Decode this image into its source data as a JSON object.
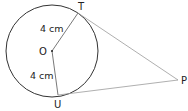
{
  "diagram": {
    "type": "geometry",
    "points": {
      "O": {
        "label": "O",
        "x": 52,
        "y": 51
      },
      "T": {
        "label": "T",
        "x": 78,
        "y": 13
      },
      "U": {
        "label": "U",
        "x": 58,
        "y": 94
      },
      "P": {
        "label": "P",
        "x": 178,
        "y": 80
      }
    },
    "circle": {
      "center": "O",
      "r": 46,
      "radius_label": "4 cm"
    },
    "segments": [
      {
        "from": "O",
        "to": "T",
        "label": "4 cm"
      },
      {
        "from": "O",
        "to": "U",
        "label": "4 cm"
      },
      {
        "from": "T",
        "to": "P",
        "label": ""
      },
      {
        "from": "U",
        "to": "P",
        "label": ""
      }
    ],
    "labels": {
      "radius_OT": "4 cm",
      "radius_OU": "4 cm",
      "point_O": "O",
      "point_T": "T",
      "point_U": "U",
      "point_P": "P"
    },
    "colors": {
      "circle": "#333333",
      "radius": "#555555",
      "tangent": "#9a9a9a",
      "text": "#222222"
    }
  }
}
